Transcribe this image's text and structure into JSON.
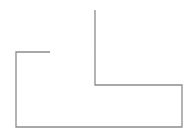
{
  "canvas": {
    "width": 194,
    "height": 138,
    "background": "#ffffff"
  },
  "stroke": {
    "color": "#8c8c8c",
    "width": 1.3
  },
  "paths": [
    {
      "name": "outer-path",
      "points": [
        [
          50,
          52
        ],
        [
          16,
          52
        ],
        [
          16,
          127
        ],
        [
          182,
          127
        ],
        [
          182,
          85
        ],
        [
          95,
          85
        ],
        [
          95,
          10
        ]
      ]
    }
  ]
}
